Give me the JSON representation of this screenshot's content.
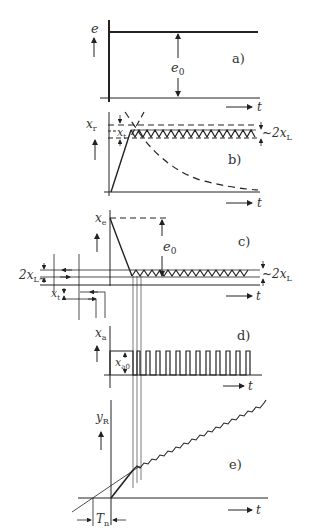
{
  "figure": {
    "panels": [
      {
        "id": "a",
        "tag": "a)",
        "y_label": "e",
        "annotation": "e",
        "annotation_sub": "0",
        "x_label": "t"
      },
      {
        "id": "b",
        "tag": "b)",
        "y_label": "x",
        "y_label_sub": "r",
        "inner_label": "x",
        "inner_label_sub": "t",
        "band_label": "2x",
        "band_label_sub": "L",
        "x_label": "t"
      },
      {
        "id": "c",
        "tag": "c)",
        "y_label": "x",
        "y_label_sub": "e",
        "annotation": "e",
        "annotation_sub": "0",
        "band_label_right": "2x",
        "band_label_right_sub": "L",
        "band_label_left": "2x",
        "band_label_left_sub": "L",
        "inner_label": "x",
        "inner_label_sub": "t",
        "x_label": "t"
      },
      {
        "id": "d",
        "tag": "d)",
        "y_label": "x",
        "y_label_sub": "a",
        "amplitude": "x",
        "amplitude_sub": "a0",
        "x_label": "t"
      },
      {
        "id": "e",
        "tag": "e)",
        "y_label": "y",
        "y_label_sub": "R",
        "time_const": "T",
        "time_const_sub": "n",
        "x_label": "t"
      }
    ]
  },
  "colors": {
    "ink": "#222222",
    "background": "#ffffff"
  }
}
